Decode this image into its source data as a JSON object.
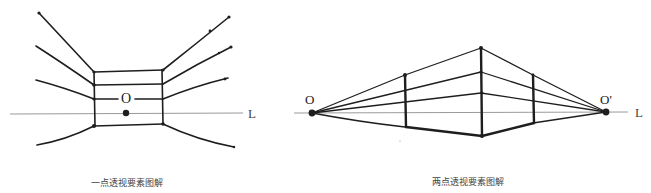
{
  "figures": [
    {
      "id": "one-point",
      "caption": "一点透视要素图解",
      "vanishing_point_label": "O",
      "horizon_label": "L"
    },
    {
      "id": "two-point",
      "caption": "两点透视要素图解",
      "vanishing_point_left_label": "O",
      "vanishing_point_right_label": "O'",
      "horizon_label": "L"
    }
  ],
  "colors": {
    "ink": "#1e1e1e",
    "horizon": "#9a9a9a",
    "caption": "#444444"
  }
}
